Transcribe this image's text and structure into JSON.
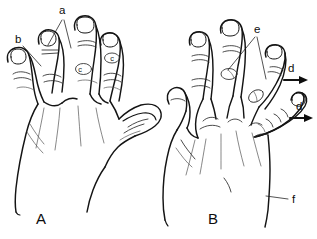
{
  "figure": {
    "background_color": "#ffffff",
    "ink_color": "#141414",
    "width": 317,
    "height": 239
  },
  "panels": [
    {
      "id": "panel-a",
      "letter": "A",
      "letter_x": 41,
      "letter_y": 224,
      "description": "Left illustration: dorsum of a hand, fingers extended, thumb folded across"
    },
    {
      "id": "panel-b",
      "letter": "B",
      "letter_x": 213,
      "letter_y": 224,
      "description": "Right illustration: dorsum of a hand with deviated fingers"
    }
  ],
  "annotations": [
    {
      "id": "label-a",
      "text": "a",
      "panel": "A",
      "x": 59,
      "y": 14,
      "type": "leader-fork",
      "targets": [
        [
          48,
          45
        ],
        [
          71,
          48
        ]
      ]
    },
    {
      "id": "label-b",
      "text": "b",
      "panel": "A",
      "x": 17,
      "y": 43,
      "type": "leader-line",
      "targets": [
        [
          40,
          65
        ]
      ]
    },
    {
      "id": "label-c-index",
      "text": "c",
      "panel": "A",
      "x": 72,
      "y": 71,
      "type": "circled-marker"
    },
    {
      "id": "label-c-middle",
      "text": "c",
      "panel": "A",
      "x": 108,
      "y": 60,
      "type": "circled-marker"
    },
    {
      "id": "label-e",
      "text": "e",
      "panel": "B",
      "x": 254,
      "y": 31,
      "type": "leader-fork",
      "targets": [
        [
          228,
          69
        ],
        [
          266,
          78
        ]
      ]
    },
    {
      "id": "label-d-upper",
      "text": "d",
      "panel": "B",
      "x": 290,
      "y": 70,
      "type": "arrow-right",
      "arrow_from": [
        283,
        80
      ],
      "arrow_to": [
        305,
        80
      ]
    },
    {
      "id": "label-d-lower",
      "text": "d",
      "panel": "B",
      "x": 298,
      "y": 108,
      "type": "arrow-right",
      "arrow_from": [
        288,
        118
      ],
      "arrow_to": [
        310,
        118
      ]
    },
    {
      "id": "label-f",
      "text": "f",
      "panel": "B",
      "x": 293,
      "y": 201,
      "type": "leader-line",
      "targets": [
        [
          265,
          198
        ]
      ]
    }
  ],
  "legend_keys": [
    "a",
    "b",
    "c",
    "d",
    "e",
    "f"
  ]
}
